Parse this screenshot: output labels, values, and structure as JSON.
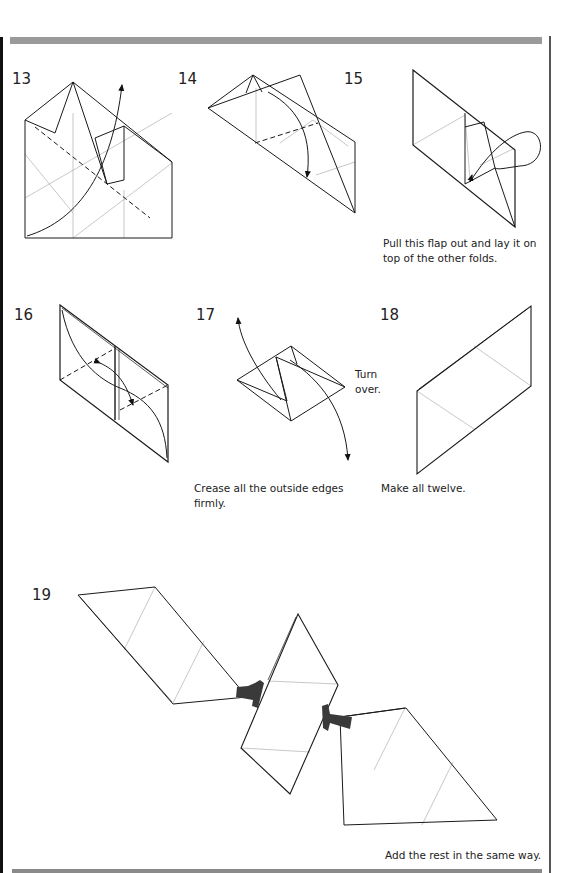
{
  "page": {
    "decor": {
      "top_bar_color": "#9a9a9a",
      "line_color": "#1a1a1a",
      "crease_color": "#a0a0a0",
      "connector_color": "#3a3a3a"
    }
  },
  "steps": [
    {
      "number": "13",
      "caption": ""
    },
    {
      "number": "14",
      "caption": ""
    },
    {
      "number": "15",
      "caption": "Pull this flap out and lay it on top of the other folds."
    },
    {
      "number": "16",
      "caption": ""
    },
    {
      "number": "17",
      "caption": "Crease all the outside edges firmly.",
      "side_note": "Turn over."
    },
    {
      "number": "18",
      "caption": "Make all twelve."
    },
    {
      "number": "19",
      "caption": "Add the rest in the same way."
    }
  ]
}
